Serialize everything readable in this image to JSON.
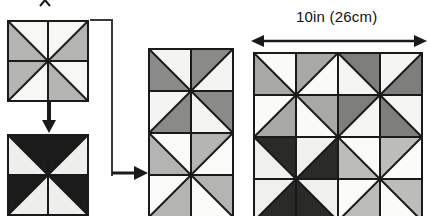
{
  "diagram": {
    "type": "quilt-block-assembly-diagram",
    "title": "",
    "measurement_label": "10in (26cm)",
    "palette": {
      "white": "#ffffff",
      "off_white": "#f2f2f0",
      "light_gray": "#d2d2d0",
      "mid_gray": "#b4b4b2",
      "dark_gray": "#8a8a88",
      "black": "#1c1c1c",
      "outline": "#1a1a1a"
    },
    "steps": [
      {
        "id": "step-1",
        "name": "single-light-pinwheel-block",
        "position": {
          "x": 7,
          "y": 20,
          "size": 82
        },
        "grid": 1,
        "pinwheel_fill": "#b4b4b2",
        "pinwheel_bg": "#f8f8f6",
        "description": "single pinwheel block in light gray"
      },
      {
        "id": "step-2",
        "name": "single-dark-pinwheel-block",
        "position": {
          "x": 7,
          "y": 134,
          "size": 82
        },
        "grid": 1,
        "pinwheel_fill": "#1c1c1c",
        "pinwheel_bg": "#eeeeec",
        "description": "single pinwheel block in black"
      },
      {
        "id": "step-3",
        "name": "two-block-column",
        "position": {
          "x": 148,
          "y": 48,
          "size": 84
        },
        "grid_cols": 1,
        "grid_rows": 2,
        "description": "vertical pair of pinwheel blocks"
      },
      {
        "id": "step-4",
        "name": "four-block-finished-unit",
        "position": {
          "x": 253,
          "y": 52,
          "size": 86
        },
        "grid_cols": 2,
        "grid_rows": 2,
        "description": "finished 2 by 2 pinwheel quilt unit"
      }
    ],
    "column_blocks": [
      {
        "fill": "#8a8a88",
        "bg": "#f4f4f2"
      },
      {
        "fill": "#b4b4b2",
        "bg": "#fbfbf9"
      }
    ],
    "unit_blocks": [
      {
        "fill": "#a8a8a6",
        "bg": "#fafaf8"
      },
      {
        "fill": "#7e7e7c",
        "bg": "#f5f5f3"
      },
      {
        "fill": "#2a2a28",
        "bg": "#f0f0ee"
      },
      {
        "fill": "#bcbcba",
        "bg": "#fbfbf9"
      }
    ],
    "connectors": [
      {
        "name": "down-arrow",
        "from": "step-1",
        "to": "step-2",
        "direction": "down"
      },
      {
        "name": "bracket-right-arrow",
        "from": "step-1-and-2",
        "to": "step-3",
        "direction": "right"
      },
      {
        "name": "measure-arrow",
        "for": "step-4",
        "direction": "both",
        "label": "10in (26cm)"
      }
    ]
  }
}
